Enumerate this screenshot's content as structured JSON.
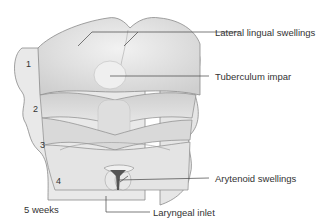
{
  "diagram": {
    "caption": "5 weeks",
    "labels": {
      "lateral_lingual_swellings": "Lateral lingual swellings",
      "tuberculum_impar": "Tuberculum impar",
      "arytenoid_swellings": "Arytenoid swellings",
      "laryngeal_inlet": "Laryngeal inlet"
    },
    "arches": [
      "1",
      "2",
      "3",
      "4"
    ],
    "colors": {
      "tissue_light": "#ececec",
      "tissue_mid": "#d4d4d4",
      "tissue_dark": "#b8b8b8",
      "outline": "#8a8a8a",
      "leader_line": "#444444",
      "inlet": "#555555"
    }
  }
}
